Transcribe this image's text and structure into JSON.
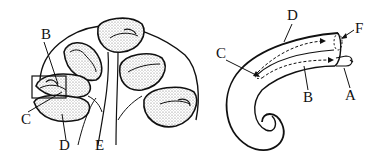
{
  "figure": {
    "left_panel": {
      "description": "Cochlea cross-section with canals around modiolus",
      "labels": [
        {
          "id": "B",
          "text": "B",
          "x": 41,
          "y": 39
        },
        {
          "id": "C",
          "text": "C",
          "x": 21,
          "y": 124
        },
        {
          "id": "D",
          "text": "D",
          "x": 59,
          "y": 150
        },
        {
          "id": "E",
          "text": "E",
          "x": 95,
          "y": 150
        }
      ]
    },
    "right_panel": {
      "description": "Uncoiled cochlea spiral with dashed flow arrows",
      "labels": [
        {
          "id": "D",
          "text": "D",
          "x": 292,
          "y": 20
        },
        {
          "id": "F",
          "text": "F",
          "x": 355,
          "y": 33
        },
        {
          "id": "C",
          "text": "C",
          "x": 218,
          "y": 56
        },
        {
          "id": "B",
          "text": "B",
          "x": 307,
          "y": 101
        },
        {
          "id": "A",
          "text": "A",
          "x": 348,
          "y": 98
        }
      ]
    },
    "colors": {
      "ink": "#111111",
      "shade": "#9a9a9a",
      "background": "#ffffff"
    }
  }
}
